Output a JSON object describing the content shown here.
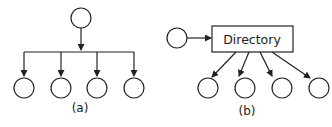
{
  "figure_a": {
    "label": "(a)",
    "root_node": "circle",
    "children_count": 4
  },
  "figure_b": {
    "label": "(b)",
    "source_node": "circle",
    "box_label": "Directory",
    "children_count": 4
  },
  "colors": {
    "stroke": "#222222",
    "background": "#ffffff"
  }
}
